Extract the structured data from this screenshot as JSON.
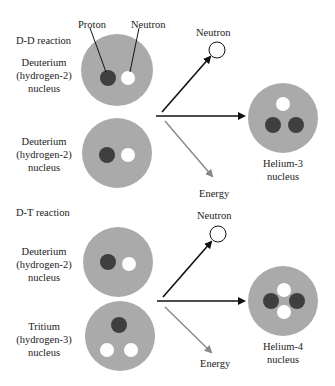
{
  "colors": {
    "nucleus": "#aaaaaa",
    "proton": "#3f3f3f",
    "neutron": "#ffffff",
    "arrow": "#111111",
    "energy_arrow": "#888888"
  },
  "dd": {
    "title": "D-D reaction",
    "callout_proton": "Proton",
    "callout_neutron": "Neutron",
    "reactant1": {
      "line1": "Deuterium",
      "line2": "(hydrogen-2)",
      "line3": "nucleus"
    },
    "reactant2": {
      "line1": "Deuterium",
      "line2": "(hydrogen-2)",
      "line3": "nucleus"
    },
    "neutron_label": "Neutron",
    "energy_label": "Energy",
    "product": {
      "line1": "Helium-3",
      "line2": "nucleus"
    }
  },
  "dt": {
    "title": "D-T reaction",
    "reactant1": {
      "line1": "Deuterium",
      "line2": "(hydrogen-2)",
      "line3": "nucleus"
    },
    "reactant2": {
      "line1": "Tritium",
      "line2": "(hydrogen-3)",
      "line3": "nucleus"
    },
    "neutron_label": "Neutron",
    "energy_label": "Energy",
    "product": {
      "line1": "Helium-4",
      "line2": "nucleus"
    }
  }
}
